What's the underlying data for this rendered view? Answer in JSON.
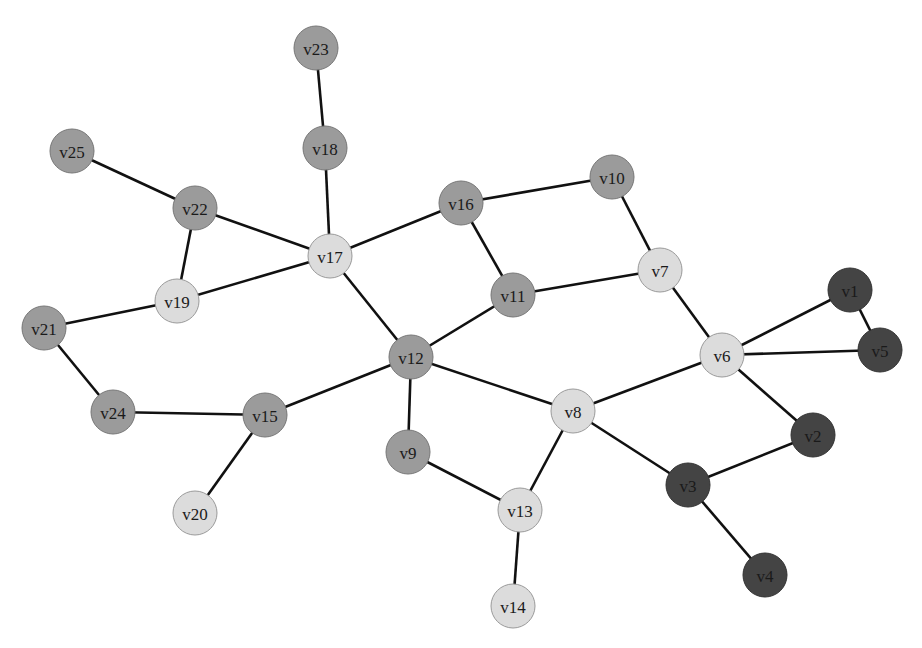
{
  "diagram": {
    "type": "undirected-graph",
    "node_radius": 22,
    "palette": {
      "light": {
        "fill": "#dcdcdc",
        "stroke": "#9a9a9a"
      },
      "medium": {
        "fill": "#9b9b9b",
        "stroke": "#777777"
      },
      "dark": {
        "fill": "#444444",
        "stroke": "#333333"
      }
    },
    "nodes": [
      {
        "id": "v1",
        "label": "v1",
        "x": 850,
        "y": 290,
        "group": "dark"
      },
      {
        "id": "v2",
        "label": "v2",
        "x": 813,
        "y": 435,
        "group": "dark"
      },
      {
        "id": "v3",
        "label": "v3",
        "x": 688,
        "y": 485,
        "group": "dark"
      },
      {
        "id": "v4",
        "label": "v4",
        "x": 765,
        "y": 575,
        "group": "dark"
      },
      {
        "id": "v5",
        "label": "v5",
        "x": 880,
        "y": 350,
        "group": "dark"
      },
      {
        "id": "v6",
        "label": "v6",
        "x": 722,
        "y": 355,
        "group": "light"
      },
      {
        "id": "v7",
        "label": "v7",
        "x": 660,
        "y": 270,
        "group": "light"
      },
      {
        "id": "v8",
        "label": "v8",
        "x": 573,
        "y": 411,
        "group": "light"
      },
      {
        "id": "v9",
        "label": "v9",
        "x": 408,
        "y": 452,
        "group": "medium"
      },
      {
        "id": "v10",
        "label": "v10",
        "x": 612,
        "y": 177,
        "group": "medium"
      },
      {
        "id": "v11",
        "label": "v11",
        "x": 513,
        "y": 295,
        "group": "medium"
      },
      {
        "id": "v12",
        "label": "v12",
        "x": 411,
        "y": 357,
        "group": "medium"
      },
      {
        "id": "v13",
        "label": "v13",
        "x": 520,
        "y": 510,
        "group": "light"
      },
      {
        "id": "v14",
        "label": "v14",
        "x": 513,
        "y": 606,
        "group": "light"
      },
      {
        "id": "v15",
        "label": "v15",
        "x": 265,
        "y": 415,
        "group": "medium"
      },
      {
        "id": "v16",
        "label": "v16",
        "x": 461,
        "y": 203,
        "group": "medium"
      },
      {
        "id": "v17",
        "label": "v17",
        "x": 330,
        "y": 256,
        "group": "light"
      },
      {
        "id": "v18",
        "label": "v18",
        "x": 325,
        "y": 148,
        "group": "medium"
      },
      {
        "id": "v19",
        "label": "v19",
        "x": 177,
        "y": 301,
        "group": "light"
      },
      {
        "id": "v20",
        "label": "v20",
        "x": 195,
        "y": 513,
        "group": "light"
      },
      {
        "id": "v21",
        "label": "v21",
        "x": 44,
        "y": 328,
        "group": "medium"
      },
      {
        "id": "v22",
        "label": "v22",
        "x": 195,
        "y": 208,
        "group": "medium"
      },
      {
        "id": "v23",
        "label": "v23",
        "x": 316,
        "y": 48,
        "group": "medium"
      },
      {
        "id": "v24",
        "label": "v24",
        "x": 113,
        "y": 412,
        "group": "medium"
      },
      {
        "id": "v25",
        "label": "v25",
        "x": 72,
        "y": 151,
        "group": "medium"
      }
    ],
    "edges": [
      [
        "v23",
        "v18"
      ],
      [
        "v18",
        "v17"
      ],
      [
        "v25",
        "v22"
      ],
      [
        "v22",
        "v17"
      ],
      [
        "v22",
        "v19"
      ],
      [
        "v19",
        "v17"
      ],
      [
        "v19",
        "v21"
      ],
      [
        "v21",
        "v24"
      ],
      [
        "v24",
        "v15"
      ],
      [
        "v15",
        "v20"
      ],
      [
        "v15",
        "v12"
      ],
      [
        "v17",
        "v16"
      ],
      [
        "v17",
        "v12"
      ],
      [
        "v16",
        "v10"
      ],
      [
        "v16",
        "v11"
      ],
      [
        "v10",
        "v7"
      ],
      [
        "v11",
        "v7"
      ],
      [
        "v11",
        "v12"
      ],
      [
        "v12",
        "v9"
      ],
      [
        "v12",
        "v8"
      ],
      [
        "v9",
        "v13"
      ],
      [
        "v8",
        "v13"
      ],
      [
        "v13",
        "v14"
      ],
      [
        "v8",
        "v6"
      ],
      [
        "v8",
        "v3"
      ],
      [
        "v7",
        "v6"
      ],
      [
        "v6",
        "v1"
      ],
      [
        "v6",
        "v5"
      ],
      [
        "v1",
        "v5"
      ],
      [
        "v6",
        "v2"
      ],
      [
        "v2",
        "v3"
      ],
      [
        "v3",
        "v4"
      ]
    ]
  }
}
